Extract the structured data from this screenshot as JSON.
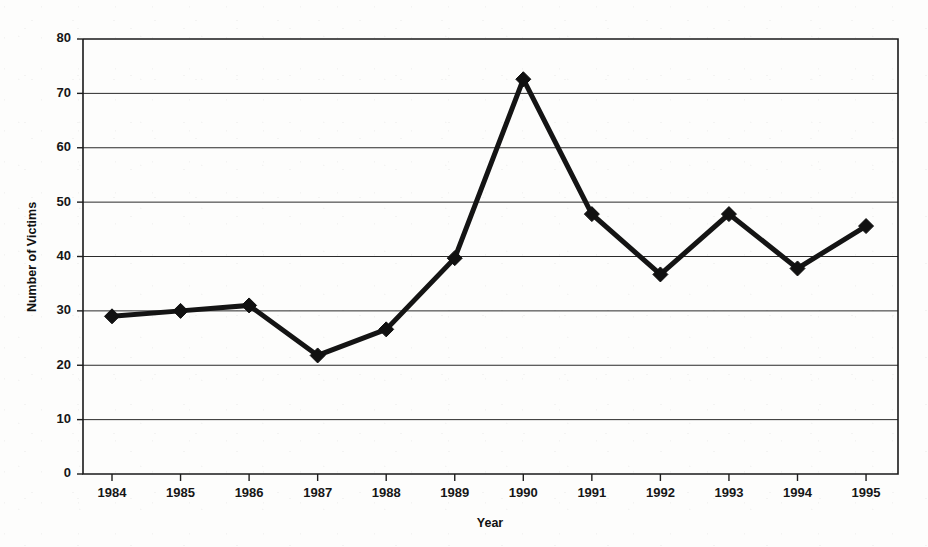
{
  "chart_data": {
    "type": "line",
    "title": "",
    "xlabel": "Year",
    "ylabel": "Number of Victims",
    "categories": [
      "1984",
      "1985",
      "1986",
      "1987",
      "1988",
      "1989",
      "1990",
      "1991",
      "1992",
      "1993",
      "1994",
      "1995"
    ],
    "values": [
      29,
      30,
      31,
      21.8,
      26.6,
      39.7,
      72.6,
      47.8,
      36.7,
      47.8,
      37.8,
      45.6
    ],
    "series": [
      {
        "name": "Number of Victims",
        "values": [
          29,
          30,
          31,
          21.8,
          26.6,
          39.7,
          72.6,
          47.8,
          36.7,
          47.8,
          37.8,
          45.6
        ]
      }
    ],
    "ylim": [
      0,
      80
    ],
    "y_ticks": [
      0,
      10,
      20,
      30,
      40,
      50,
      60,
      70,
      80
    ],
    "y_tick_labels": [
      "0",
      "10",
      "20",
      "30",
      "40",
      "50",
      "60",
      "70",
      "80"
    ],
    "x_tick_labels": [
      "1984",
      "1985",
      "1986",
      "1987",
      "1988",
      "1989",
      "1990",
      "1991",
      "1992",
      "1993",
      "1994",
      "1995"
    ],
    "grid": "horizontal",
    "legend": "none",
    "marker": "diamond",
    "line_color": "#141414",
    "marker_color": "#111111",
    "grid_color": "#2a2a2a",
    "background_color": "#fdfdfc"
  },
  "axes": {
    "y_label": "Number of Victims",
    "x_label": "Year"
  }
}
